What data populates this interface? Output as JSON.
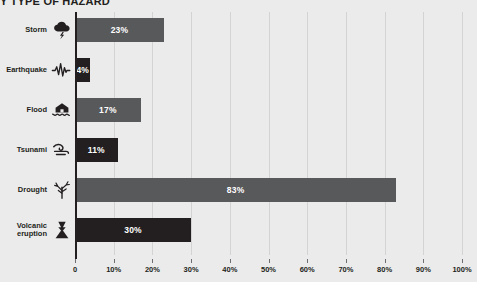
{
  "chart_data": {
    "type": "bar",
    "orientation": "horizontal",
    "title": "Y TYPE OF HAZARD",
    "xlabel": "",
    "ylabel": "",
    "xlim": [
      0,
      100
    ],
    "grid": true,
    "legend": "none",
    "categories": [
      "Storm",
      "Earthquake",
      "Flood",
      "Tsunami",
      "Drought",
      "Volcanic\neruption"
    ],
    "values": [
      23,
      17,
      17,
      11,
      83,
      30
    ],
    "value_labels": [
      "23%",
      "4%",
      "17%",
      "11%",
      "83%",
      "30%"
    ],
    "bars": [
      {
        "category": "Storm",
        "value": 23,
        "label": "23%",
        "color": "#58595b",
        "icon": "storm-icon"
      },
      {
        "category": "Earthquake",
        "value": 4,
        "label": "4%",
        "color": "#231f20",
        "icon": "earthquake-icon"
      },
      {
        "category": "Flood",
        "value": 17,
        "label": "17%",
        "color": "#58595b",
        "icon": "flood-icon"
      },
      {
        "category": "Tsunami",
        "value": 11,
        "label": "11%",
        "color": "#231f20",
        "icon": "tsunami-icon"
      },
      {
        "category": "Drought",
        "value": 83,
        "label": "83%",
        "color": "#58595b",
        "icon": "drought-icon"
      },
      {
        "category": "Volcanic\neruption",
        "value": 30,
        "label": "30%",
        "color": "#231f20",
        "icon": "volcano-icon"
      }
    ],
    "xticks": [
      0,
      10,
      20,
      30,
      40,
      50,
      60,
      70,
      80,
      90,
      100
    ],
    "xtick_labels": [
      "0",
      "10%",
      "20%",
      "30%",
      "40%",
      "50%",
      "60%",
      "70%",
      "80%",
      "90%",
      "100%"
    ],
    "colors": {
      "background": "#ebebeb",
      "gridline": "#d3d3d3",
      "axis": "#231f20",
      "bar_light": "#58595b",
      "bar_dark": "#231f20",
      "text": "#231f20",
      "bar_label_text": "#ffffff"
    }
  }
}
